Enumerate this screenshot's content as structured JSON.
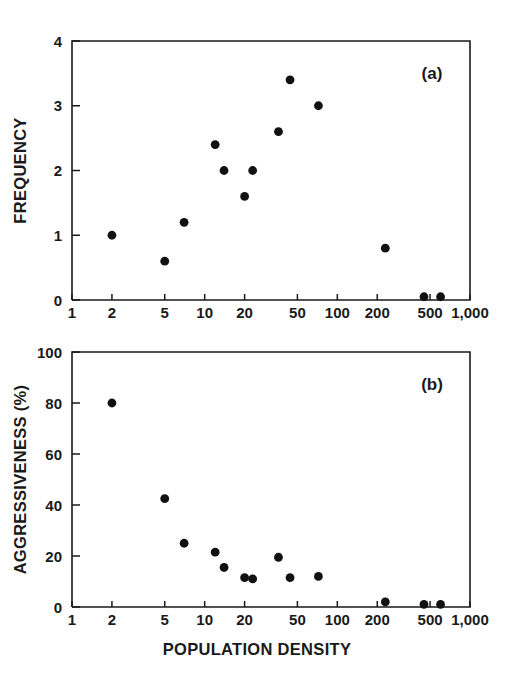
{
  "figure": {
    "title": "",
    "panel_count": 2
  },
  "chart_data": [
    {
      "type": "scatter",
      "panel": "a",
      "panel_label": "(a)",
      "title": "",
      "xlabel": "",
      "ylabel": "FREQUENCY",
      "xscale": "log",
      "xlim": [
        1,
        1000
      ],
      "ylim": [
        0,
        4
      ],
      "grid": false,
      "legend": "none",
      "xticks": [
        1,
        2,
        5,
        10,
        20,
        50,
        100,
        200,
        500,
        1000
      ],
      "xticklabels": [
        "1",
        "2",
        "5",
        "10",
        "20",
        "50",
        "100",
        "200",
        "500",
        "1,000"
      ],
      "yticks": [
        0,
        1,
        2,
        3,
        4
      ],
      "yticklabels": [
        "0",
        "1",
        "2",
        "3",
        "4"
      ],
      "marker": "filled-circle",
      "marker_color": "#111111",
      "points": [
        {
          "x": 2,
          "y": 1.0
        },
        {
          "x": 5,
          "y": 0.6
        },
        {
          "x": 7,
          "y": 1.2
        },
        {
          "x": 12,
          "y": 2.4
        },
        {
          "x": 14,
          "y": 2.0
        },
        {
          "x": 20,
          "y": 1.6
        },
        {
          "x": 23,
          "y": 2.0
        },
        {
          "x": 36,
          "y": 2.6
        },
        {
          "x": 44,
          "y": 3.4
        },
        {
          "x": 72,
          "y": 3.0
        },
        {
          "x": 230,
          "y": 0.8
        },
        {
          "x": 450,
          "y": 0.05
        },
        {
          "x": 600,
          "y": 0.05
        }
      ]
    },
    {
      "type": "scatter",
      "panel": "b",
      "panel_label": "(b)",
      "title": "",
      "xlabel": "POPULATION DENSITY",
      "ylabel": "AGGRESSIVENESS (%)",
      "xscale": "log",
      "xlim": [
        1,
        1000
      ],
      "ylim": [
        0,
        100
      ],
      "grid": false,
      "legend": "none",
      "xticks": [
        1,
        2,
        5,
        10,
        20,
        50,
        100,
        200,
        500,
        1000
      ],
      "xticklabels": [
        "1",
        "2",
        "5",
        "10",
        "20",
        "50",
        "100",
        "200",
        "500",
        "1,000"
      ],
      "yticks": [
        0,
        20,
        40,
        60,
        80,
        100
      ],
      "yticklabels": [
        "0",
        "20",
        "40",
        "60",
        "80",
        "100"
      ],
      "marker": "filled-circle",
      "marker_color": "#111111",
      "points": [
        {
          "x": 2,
          "y": 80.0
        },
        {
          "x": 5,
          "y": 42.5
        },
        {
          "x": 7,
          "y": 25.0
        },
        {
          "x": 12,
          "y": 21.5
        },
        {
          "x": 14,
          "y": 15.5
        },
        {
          "x": 20,
          "y": 11.5
        },
        {
          "x": 23,
          "y": 11.0
        },
        {
          "x": 36,
          "y": 19.5
        },
        {
          "x": 44,
          "y": 11.5
        },
        {
          "x": 72,
          "y": 12.0
        },
        {
          "x": 230,
          "y": 2.0
        },
        {
          "x": 450,
          "y": 1.0
        },
        {
          "x": 600,
          "y": 1.0
        }
      ]
    }
  ],
  "geometry": {
    "panel_a": {
      "left": 72,
      "right": 470,
      "top": 41,
      "bottom": 300
    },
    "panel_b": {
      "left": 72,
      "right": 470,
      "top": 352,
      "bottom": 607
    }
  },
  "colors": {
    "marker": "#111111",
    "axis": "#1a1a1a",
    "background": "#ffffff"
  }
}
